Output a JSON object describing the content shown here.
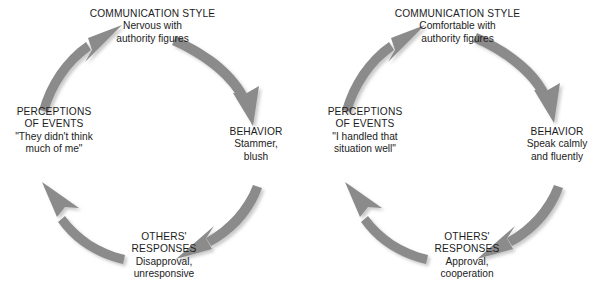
{
  "figure": {
    "arrow_color": "#8b8b8b",
    "arrow_shadow_color": "#cfcfcf",
    "text_color": "#1c1c1c",
    "background": "#ffffff"
  },
  "cycles": [
    {
      "id": "negative-cycle",
      "nodes": {
        "communication_style": {
          "heading": "COMMUNICATION STYLE",
          "detail_line1": "Nervous with",
          "detail_line2": "authority figures"
        },
        "behavior": {
          "heading": "BEHAVIOR",
          "detail_line1": "Stammer,",
          "detail_line2": "blush"
        },
        "others_responses": {
          "heading_line1": "OTHERS'",
          "heading_line2": "RESPONSES",
          "detail_line1": "Disapproval,",
          "detail_line2": "unresponsive"
        },
        "perceptions_of_events": {
          "heading_line1": "PERCEPTIONS",
          "heading_line2": "OF EVENTS",
          "detail_line1": "\"They didn't think",
          "detail_line2": "much of me\""
        }
      },
      "arrows": [
        {
          "name": "communication-style-to-behavior",
          "direction": "clockwise-top-right"
        },
        {
          "name": "behavior-to-others-responses",
          "direction": "clockwise-bottom-right"
        },
        {
          "name": "others-responses-to-perceptions",
          "direction": "clockwise-bottom-left"
        },
        {
          "name": "perceptions-to-communication-style",
          "direction": "clockwise-top-left"
        }
      ]
    },
    {
      "id": "positive-cycle",
      "nodes": {
        "communication_style": {
          "heading": "COMMUNICATION STYLE",
          "detail_line1": "Comfortable with",
          "detail_line2": "authority figures"
        },
        "behavior": {
          "heading": "BEHAVIOR",
          "detail_line1": "Speak calmly",
          "detail_line2": "and fluently"
        },
        "others_responses": {
          "heading_line1": "OTHERS'",
          "heading_line2": "RESPONSES",
          "detail_line1": "Approval,",
          "detail_line2": "cooperation"
        },
        "perceptions_of_events": {
          "heading_line1": "PERCEPTIONS",
          "heading_line2": "OF EVENTS",
          "detail_line1": "\"I handled that",
          "detail_line2": "situation well\""
        }
      },
      "arrows": [
        {
          "name": "communication-style-to-behavior",
          "direction": "clockwise-top-right"
        },
        {
          "name": "behavior-to-others-responses",
          "direction": "clockwise-bottom-right"
        },
        {
          "name": "others-responses-to-perceptions",
          "direction": "clockwise-bottom-left"
        },
        {
          "name": "perceptions-to-communication-style",
          "direction": "clockwise-top-left"
        }
      ]
    }
  ]
}
